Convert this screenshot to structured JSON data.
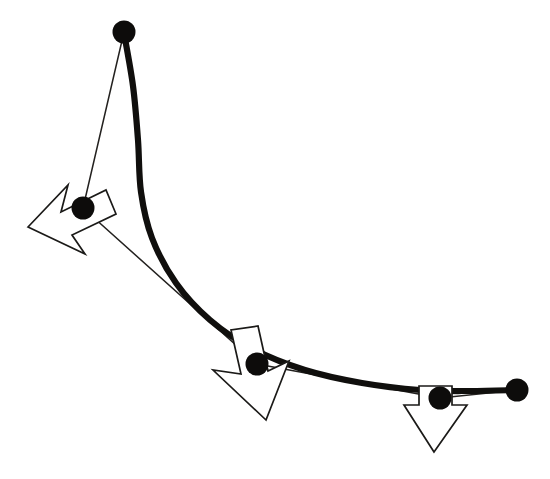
{
  "figure": {
    "background_color": "#ffffff",
    "width": 550,
    "height": 479
  },
  "style": {
    "curve_color": "#100f0d",
    "curve_width": 6.2,
    "polygon_color": "#23211f",
    "polygon_width": 1.5,
    "point_color": "#0d0c0b",
    "point_radius": 11.5,
    "arrow_fill": "#ffffff",
    "arrow_stroke": "#1b1a18",
    "arrow_stroke_width": 1.7
  },
  "chart_data": {
    "type": "line",
    "xlabel": "",
    "ylabel": "",
    "grid": false,
    "legend": "none",
    "xlim": [
      0,
      550
    ],
    "ylim": [
      0,
      479
    ],
    "control_points": [
      {
        "id": "p0",
        "label": "P0",
        "x": 124,
        "y": 32
      },
      {
        "id": "p1",
        "label": "P1",
        "x": 83,
        "y": 208
      },
      {
        "id": "p2",
        "label": "P2",
        "x": 257,
        "y": 364
      },
      {
        "id": "p3",
        "label": "P3",
        "x": 440,
        "y": 398
      },
      {
        "id": "p4",
        "label": "P4",
        "x": 517,
        "y": 390
      }
    ],
    "control_polygon_path": "M 124 32 L 83 208 L 257 364 L 440 398 L 517 390",
    "curve_path": "M 124 33 C 133 78 140 128 139 170 C 138 212 128 243 113 268 C 96 297 72 327 48 352 C 24 377 2 396 -12 406",
    "curve_path_actual": "M 124 33 C 135 80 141 132 138 176 C 135 226 118 268 92 306 C 63 349 24 386 -16 414",
    "curve_points": [
      {
        "x": 124,
        "y": 33
      },
      {
        "x": 133,
        "y": 86
      },
      {
        "x": 138,
        "y": 140
      },
      {
        "x": 141,
        "y": 192
      },
      {
        "x": 152,
        "y": 238
      },
      {
        "x": 176,
        "y": 283
      },
      {
        "x": 210,
        "y": 320
      },
      {
        "x": 253,
        "y": 349
      },
      {
        "x": 305,
        "y": 370
      },
      {
        "x": 362,
        "y": 383
      },
      {
        "x": 420,
        "y": 390
      },
      {
        "x": 470,
        "y": 391
      },
      {
        "x": 517,
        "y": 390
      }
    ],
    "arrows": [
      {
        "id": "arrow-1",
        "anchor_point_id": "p1",
        "direction": "left-down",
        "angle_deg": 196,
        "tip": {
          "x": 28,
          "y": 227
        },
        "base": {
          "x": 83,
          "y": 208
        },
        "length": 58
      },
      {
        "id": "arrow-2",
        "anchor_point_id": "p2",
        "direction": "down-left",
        "angle_deg": 104,
        "tip": {
          "x": 266,
          "y": 420
        },
        "base": {
          "x": 257,
          "y": 364
        },
        "length": 57
      },
      {
        "id": "arrow-3",
        "anchor_point_id": "p3",
        "direction": "down",
        "angle_deg": 90,
        "tip": {
          "x": 434,
          "y": 452
        },
        "base": {
          "x": 436,
          "y": 396
        },
        "length": 56
      }
    ]
  }
}
